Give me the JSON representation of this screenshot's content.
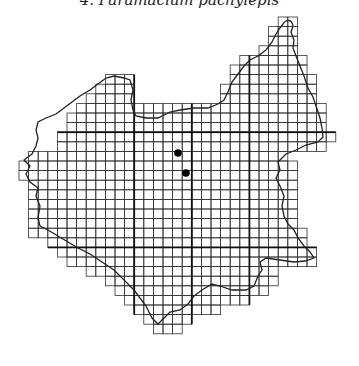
{
  "caption": "4. Paramacium pachylepis",
  "map": {
    "type": "grid-distribution-map",
    "grid": {
      "origin_x": 19,
      "origin_y": 17,
      "cell_size": 9.6,
      "line_color": "#333333",
      "major_line_color": "#111111",
      "major_every": 6
    },
    "rows": [
      [
        27,
        28
      ],
      [
        26,
        28
      ],
      [
        26,
        28
      ],
      [
        25,
        28
      ],
      [
        23,
        29
      ],
      [
        22,
        29
      ],
      [
        [
          9,
          11
        ],
        [
          22,
          30
        ]
      ],
      [
        [
          8,
          11
        ],
        [
          21,
          30
        ]
      ],
      [
        [
          7,
          11
        ],
        [
          21,
          30
        ]
      ],
      [
        6,
        31
      ],
      [
        5,
        31
      ],
      [
        5,
        31
      ],
      [
        4,
        32
      ],
      [
        4,
        31
      ],
      [
        1,
        27
      ],
      [
        0,
        28
      ],
      [
        0,
        28
      ],
      [
        1,
        28
      ],
      [
        1,
        28
      ],
      [
        1,
        28
      ],
      [
        1,
        28
      ],
      [
        1,
        28
      ],
      [
        1,
        29
      ],
      [
        3,
        29
      ],
      [
        4,
        30
      ],
      [
        5,
        30
      ],
      [
        7,
        26
      ],
      [
        9,
        26
      ],
      [
        10,
        25
      ],
      [
        11,
        23
      ],
      [
        12,
        20
      ],
      [
        13,
        17
      ],
      [
        14,
        16
      ]
    ],
    "records": [
      {
        "x": 178,
        "y": 153,
        "symbol": "filled-circle"
      },
      {
        "x": 186,
        "y": 173,
        "symbol": "filled-circle"
      }
    ],
    "record_color": "#000000"
  }
}
